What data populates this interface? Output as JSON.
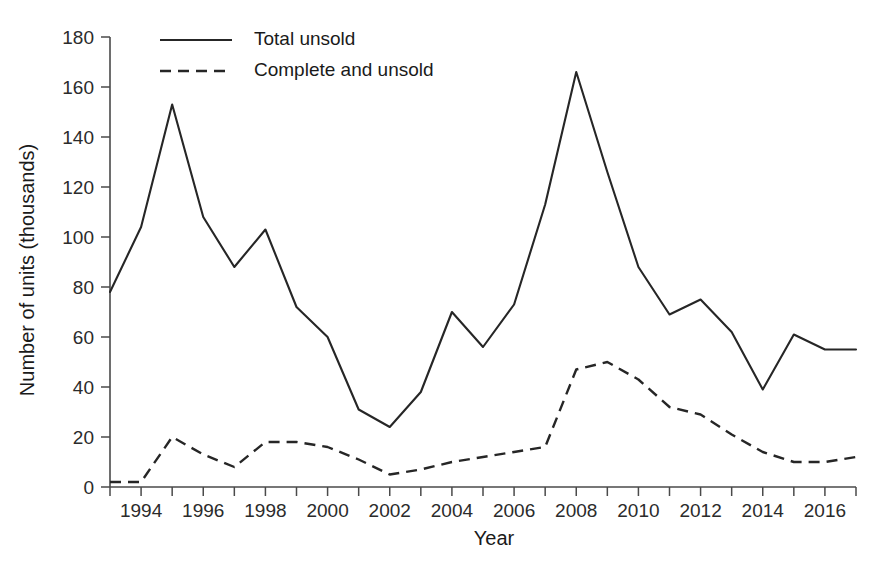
{
  "chart_data": {
    "type": "line",
    "title": "",
    "xlabel": "Year",
    "ylabel": "Number of units (thousands)",
    "xlim": [
      1993,
      2017
    ],
    "ylim": [
      0,
      180
    ],
    "grid": false,
    "legend_position": "top-left-inside",
    "x": [
      1993,
      1994,
      1995,
      1996,
      1997,
      1998,
      1999,
      2000,
      2001,
      2002,
      2003,
      2004,
      2005,
      2006,
      2007,
      2008,
      2009,
      2010,
      2011,
      2012,
      2013,
      2014,
      2015,
      2016,
      2017
    ],
    "xticks_major": [
      1994,
      1996,
      1998,
      2000,
      2002,
      2004,
      2006,
      2008,
      2010,
      2012,
      2014,
      2016
    ],
    "xtick_labels": [
      "1994",
      "1996",
      "1998",
      "2000",
      "2002",
      "2004",
      "2006",
      "2008",
      "2010",
      "2012",
      "2014",
      "2016"
    ],
    "xticks_minor": [
      1993,
      1995,
      1997,
      1999,
      2001,
      2003,
      2005,
      2007,
      2009,
      2011,
      2013,
      2015,
      2017
    ],
    "yticks": [
      0,
      20,
      40,
      60,
      80,
      100,
      120,
      140,
      160,
      180
    ],
    "ytick_labels": [
      "0",
      "20",
      "40",
      "60",
      "80",
      "100",
      "120",
      "140",
      "160",
      "180"
    ],
    "series": [
      {
        "name": "Total unsold",
        "style": "solid",
        "color": "#262626",
        "values": [
          78,
          104,
          153,
          108,
          88,
          103,
          72,
          60,
          31,
          24,
          38,
          70,
          56,
          73,
          113,
          166,
          126,
          88,
          69,
          75,
          62,
          39,
          61,
          55,
          55
        ]
      },
      {
        "name": "Complete and unsold",
        "style": "dashed",
        "color": "#262626",
        "values": [
          2,
          2,
          20,
          13,
          8,
          18,
          18,
          16,
          11,
          5,
          7,
          10,
          12,
          14,
          16,
          47,
          50,
          43,
          32,
          29,
          21,
          14,
          10,
          10,
          12
        ]
      }
    ]
  },
  "legend": {
    "entries": [
      {
        "label": "Total unsold",
        "style": "solid"
      },
      {
        "label": "Complete and unsold",
        "style": "dashed"
      }
    ]
  },
  "axes": {
    "x_title": "Year",
    "y_title": "Number of units (thousands)"
  }
}
